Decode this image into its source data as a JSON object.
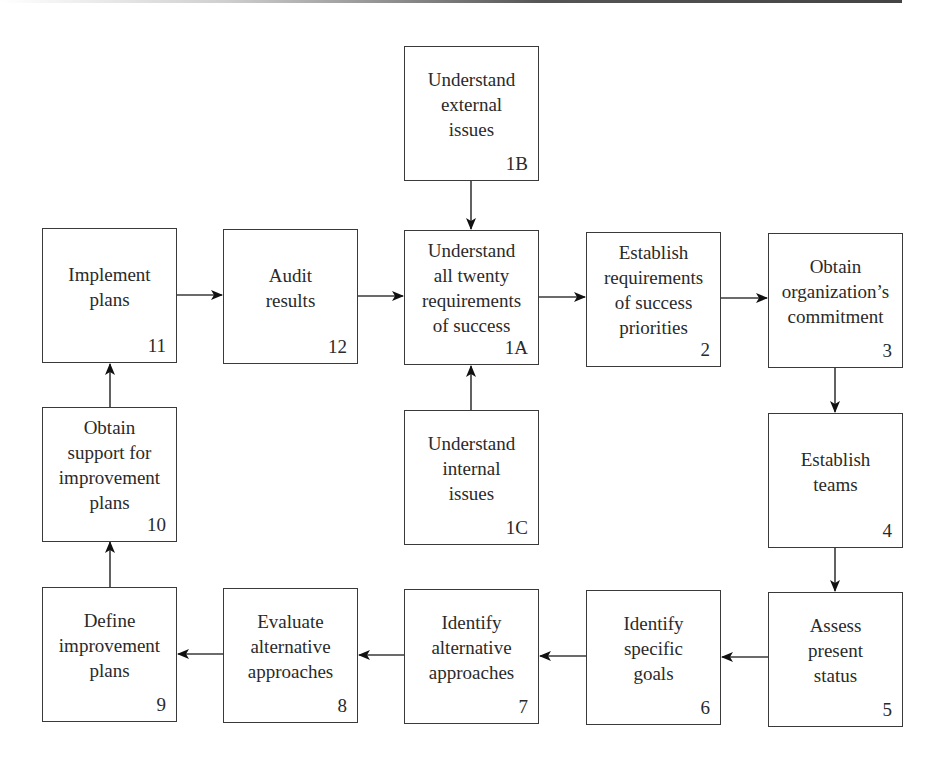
{
  "diagram": {
    "type": "process-flowchart",
    "nodes": [
      {
        "id": "1B",
        "label": "Understand\nexternal\nissues",
        "number": "1B",
        "x": 404,
        "y": 46
      },
      {
        "id": "11",
        "label": "Implement\nplans",
        "number": "11",
        "x": 42,
        "y": 228
      },
      {
        "id": "12",
        "label": "Audit\nresults",
        "number": "12",
        "x": 223,
        "y": 229
      },
      {
        "id": "1A",
        "label": "Understand\nall twenty\nrequirements\nof success",
        "number": "1A",
        "x": 404,
        "y": 230
      },
      {
        "id": "2",
        "label": "Establish\nrequirements\nof success\npriorities",
        "number": "2",
        "x": 586,
        "y": 232
      },
      {
        "id": "3",
        "label": "Obtain\norganization’s\ncommitment",
        "number": "3",
        "x": 768,
        "y": 233
      },
      {
        "id": "10",
        "label": "Obtain\nsupport for\nimprovement\nplans",
        "number": "10",
        "x": 42,
        "y": 407
      },
      {
        "id": "1C",
        "label": "Understand\ninternal\nissues",
        "number": "1C",
        "x": 404,
        "y": 410
      },
      {
        "id": "4",
        "label": "Establish\nteams",
        "number": "4",
        "x": 768,
        "y": 413
      },
      {
        "id": "9",
        "label": "Define\nimprovement\nplans",
        "number": "9",
        "x": 42,
        "y": 587
      },
      {
        "id": "8",
        "label": "Evaluate\nalternative\napproaches",
        "number": "8",
        "x": 223,
        "y": 588
      },
      {
        "id": "7",
        "label": "Identify\nalternative\napproaches",
        "number": "7",
        "x": 404,
        "y": 589
      },
      {
        "id": "6",
        "label": "Identify\nspecific\ngoals",
        "number": "6",
        "x": 586,
        "y": 590
      },
      {
        "id": "5",
        "label": "Assess\npresent\nstatus",
        "number": "5",
        "x": 768,
        "y": 592
      }
    ],
    "edges": [
      {
        "from": "1B",
        "to": "1A"
      },
      {
        "from": "1C",
        "to": "1A"
      },
      {
        "from": "1A",
        "to": "2"
      },
      {
        "from": "2",
        "to": "3"
      },
      {
        "from": "3",
        "to": "4"
      },
      {
        "from": "4",
        "to": "5"
      },
      {
        "from": "5",
        "to": "6"
      },
      {
        "from": "6",
        "to": "7"
      },
      {
        "from": "7",
        "to": "8"
      },
      {
        "from": "8",
        "to": "9"
      },
      {
        "from": "9",
        "to": "10"
      },
      {
        "from": "10",
        "to": "11"
      },
      {
        "from": "11",
        "to": "12"
      },
      {
        "from": "12",
        "to": "1A"
      }
    ],
    "colors": {
      "line": "#3a3a3a",
      "text": "#2a2a2a",
      "background": "#ffffff"
    }
  }
}
